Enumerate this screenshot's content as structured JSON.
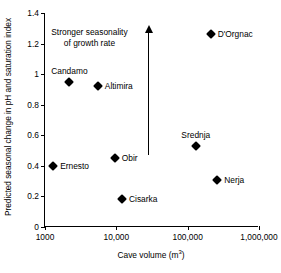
{
  "chart_data": {
    "type": "scatter",
    "title": "",
    "xlabel": "Cave volume (m³)",
    "ylabel": "Predicted seasonal change in pH and saturation index",
    "xscale": "log",
    "xlim": [
      1000,
      1000000
    ],
    "ylim": [
      0,
      1.4
    ],
    "grid": false,
    "legend": "none",
    "xtick_labels": [
      "1000",
      "10,000",
      "100,000",
      "1,000,000"
    ],
    "xtick_values": [
      1000,
      10000,
      100000,
      1000000
    ],
    "ytick_labels": [
      "0",
      "0.2",
      "0.4",
      "0.6",
      "0.8",
      "1",
      "1.2",
      "1.4"
    ],
    "ytick_values": [
      0,
      0.2,
      0.4,
      0.6,
      0.8,
      1.0,
      1.2,
      1.4
    ],
    "points": [
      {
        "label": "Ernesto",
        "x": 1300,
        "y": 0.4,
        "label_pos": "right"
      },
      {
        "label": "Candamo",
        "x": 2200,
        "y": 0.95,
        "label_pos": "above"
      },
      {
        "label": "Altimira",
        "x": 5500,
        "y": 0.92,
        "label_pos": "right"
      },
      {
        "label": "Obir",
        "x": 9500,
        "y": 0.45,
        "label_pos": "right"
      },
      {
        "label": "Cisarka",
        "x": 12000,
        "y": 0.18,
        "label_pos": "right"
      },
      {
        "label": "Srednja",
        "x": 130000,
        "y": 0.53,
        "label_pos": "above"
      },
      {
        "label": "Nerja",
        "x": 260000,
        "y": 0.31,
        "label_pos": "right"
      },
      {
        "label": "D'Orgnac",
        "x": 210000,
        "y": 1.26,
        "label_pos": "right"
      }
    ],
    "annotations": [
      {
        "text_line1": "Stronger seasonality",
        "text_line2": "of growth rate",
        "arrow_x": 28000,
        "arrow_y_start": 0.47,
        "arrow_y_end": 1.32,
        "arrow_direction": "up",
        "text_x": 4200,
        "text_y": 1.31
      }
    ]
  }
}
